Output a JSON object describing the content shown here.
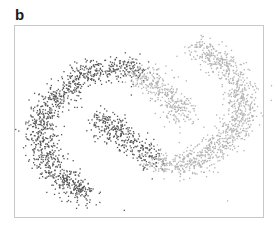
{
  "panel_label": "b",
  "chart_data": {
    "type": "scatter",
    "title": "",
    "xlabel": "",
    "ylabel": "",
    "grid": false,
    "axes_ticks": false,
    "legend": "none",
    "xlim": [
      0,
      100
    ],
    "ylim": [
      0,
      100
    ],
    "series": [
      {
        "name": "dark-cluster",
        "color": "#555555",
        "n_points": 1400,
        "spread": 3.2,
        "centerline": [
          [
            51,
            77
          ],
          [
            40,
            79
          ],
          [
            28,
            75
          ],
          [
            17,
            64
          ],
          [
            10,
            50
          ],
          [
            11,
            34
          ],
          [
            18,
            20
          ],
          [
            29,
            11
          ]
        ],
        "inner_arm": [
          [
            33,
            52
          ],
          [
            40,
            45
          ],
          [
            48,
            38
          ],
          [
            56,
            28
          ]
        ]
      },
      {
        "name": "light-cluster",
        "color": "#b3b3b3",
        "n_points": 1400,
        "spread": 3.2,
        "centerline": [
          [
            56,
            28
          ],
          [
            66,
            27
          ],
          [
            76,
            30
          ],
          [
            86,
            42
          ],
          [
            93,
            55
          ],
          [
            91,
            70
          ],
          [
            84,
            82
          ],
          [
            72,
            90
          ]
        ],
        "inner_arm": [
          [
            47,
            76
          ],
          [
            56,
            70
          ],
          [
            63,
            62
          ],
          [
            68,
            52
          ]
        ]
      }
    ],
    "outliers": [
      {
        "x": 44,
        "y": 3,
        "series": "dark-cluster"
      },
      {
        "x": 86,
        "y": 8,
        "series": "light-cluster"
      }
    ]
  }
}
